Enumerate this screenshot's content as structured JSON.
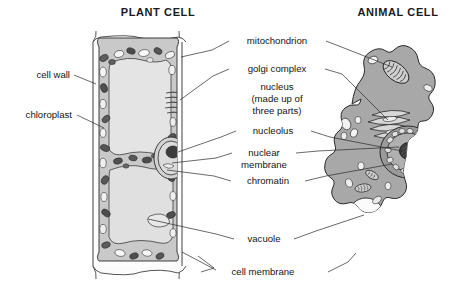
{
  "figure": {
    "kind": "biology-diagram",
    "background": "#ffffff"
  },
  "titles": {
    "plant": "PLANT CELL",
    "animal": "ANIMAL CELL"
  },
  "labels": {
    "cell_wall": "cell wall",
    "chloroplast": "chloroplast",
    "mitochondrion": "mitochondrion",
    "golgi_complex": "golgi complex",
    "nucleus_line1": "nucleus",
    "nucleus_line2": "(made up of",
    "nucleus_line3": "three parts)",
    "nucleolus": "nucleolus",
    "nuclear_line1": "nuclear",
    "nuclear_line2": "membrane",
    "chromatin": "chromatin",
    "vacuole": "vacuole",
    "cell_membrane": "cell membrane"
  },
  "colors": {
    "ink": "#2a2a2a",
    "text": "#141414",
    "plant_cytoplasm": "#c9c9c9",
    "plant_vacuole": "#e9e9e9",
    "plant_wall": "#fbfbfb",
    "animal_cytoplasm": "#a8a8a8",
    "organelle_dark": "#5e5e5e",
    "organelle_light": "#f2f2f2",
    "nucleolus": "#3d3d3d"
  },
  "label_targets": {
    "cell_wall": "plant cell outer wall",
    "chloroplast": "plant cytoplasm dark oval organelle",
    "mitochondrion": "both cells",
    "golgi_complex": "both cells",
    "nucleolus": "both cells",
    "nuclear_membrane": "both cells",
    "chromatin": "both cells",
    "vacuole": "both cells",
    "cell_membrane": "both cells"
  }
}
